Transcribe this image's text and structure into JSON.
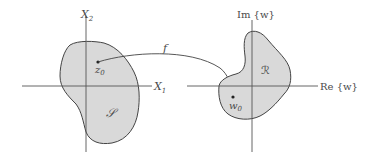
{
  "diagram": {
    "left_plane": {
      "vertical_axis_label": "X",
      "vertical_axis_sub": "2",
      "horizontal_axis_label": "X",
      "horizontal_axis_sub": "1",
      "region_label": "𝒮",
      "point_label": "z",
      "point_sub": "0"
    },
    "mapping": {
      "label": "f"
    },
    "right_plane": {
      "vertical_axis_label": "Im {w}",
      "horizontal_axis_label": "Re {w}",
      "region_label": "ℛ",
      "point_label": "w",
      "point_sub": "0"
    },
    "colors": {
      "region_fill": "#d9d9d9",
      "outline": "#444444",
      "axis": "#555555",
      "text": "#4a4a4a"
    }
  }
}
